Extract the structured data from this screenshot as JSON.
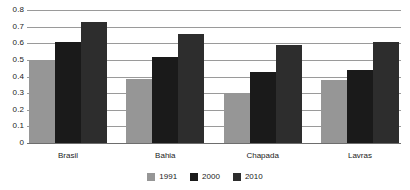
{
  "chart_data": {
    "type": "bar",
    "title": "",
    "subtitle": "",
    "xlabel": "",
    "ylabel": "",
    "categories": [
      "Brasil",
      "Bahia",
      "Chapada",
      "Lavras"
    ],
    "series": [
      {
        "name": "1991",
        "color": "#969696",
        "values": [
          0.5,
          0.385,
          0.3,
          0.378
        ]
      },
      {
        "name": "2000",
        "color": "#1a1a1a",
        "values": [
          0.61,
          0.515,
          0.43,
          0.44
        ]
      },
      {
        "name": "2010",
        "color": "#2d2d2d",
        "values": [
          0.725,
          0.655,
          0.59,
          0.605
        ]
      }
    ],
    "ylim": [
      0,
      0.8
    ],
    "yticks": [
      "0",
      "0.1",
      "0.2",
      "0.3",
      "0.4",
      "0.5",
      "0.6",
      "0.7",
      "0.8"
    ],
    "ytick_values": [
      0,
      0.1,
      0.2,
      0.3,
      0.4,
      0.5,
      0.6,
      0.7,
      0.8
    ],
    "grid": true,
    "grid_color": "#9a9a9a",
    "legend_position": "bottom",
    "background": "#ffffff"
  }
}
